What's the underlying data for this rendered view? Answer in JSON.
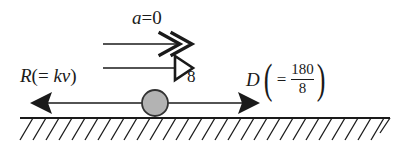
{
  "diagram": {
    "background_color": "#ffffff",
    "ink_color": "#1a1a1a",
    "ball_fill_color": "#b3b3b3"
  },
  "acceleration_vector": {
    "symbol": "a",
    "operator": "=",
    "value": "0",
    "full_label": "a = 0",
    "arrowhead_style": "double-chevron"
  },
  "velocity_vector": {
    "label": "8",
    "arrowhead_style": "hollow-triangle"
  },
  "resistance_force": {
    "symbol": "R",
    "open_paren": "(",
    "operator": "=",
    "expression": "kv",
    "close_paren": ")",
    "full_label": "R(= kv)",
    "direction": "left"
  },
  "driving_force": {
    "symbol": "D",
    "open_paren": "(",
    "operator": "=",
    "numerator": "180",
    "denominator": "8",
    "close_paren": ")",
    "full_label": "D( = 180/8 )",
    "direction": "right"
  },
  "ground": {
    "style": "hatched",
    "hatch_direction": "up-right"
  }
}
